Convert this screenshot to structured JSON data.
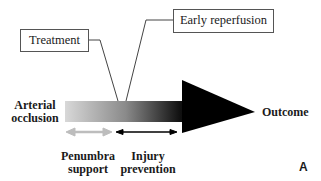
{
  "diagram": {
    "boxes": {
      "treatment": "Treatment",
      "early_reperfusion": "Early reperfusion"
    },
    "main_arrow": {
      "start_label": "Arterial\nocclusion",
      "start_label_lines": [
        "Arterial",
        "occlusion"
      ],
      "end_label": "Outcome",
      "gradient_from": "#d8d8d8",
      "gradient_to": "#000000"
    },
    "phases": [
      {
        "label_lines": [
          "Penumbra",
          "support"
        ],
        "arrow_color": "#bdbdbd"
      },
      {
        "label_lines": [
          "Injury",
          "prevention"
        ],
        "arrow_color": "#000000"
      }
    ],
    "panel_label": "A"
  }
}
